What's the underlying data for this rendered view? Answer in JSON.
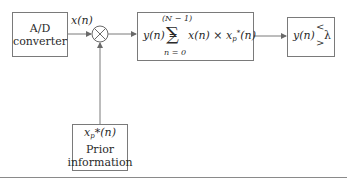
{
  "diagram": {
    "nodes": {
      "adc": {
        "line1": "A/D",
        "line2": "converter"
      },
      "multiplier": {
        "symbol": "multiply-circle"
      },
      "summation": {
        "lhs": "y(n) =",
        "upper_limit": "(N − 1)",
        "sigma": "∑",
        "lower_limit": "n = 0",
        "term_x": "x(n) × x",
        "term_sub": "p",
        "term_sup": "*",
        "term_tail": "(n)"
      },
      "decision": {
        "lhs": "y(n)",
        "lt": "<",
        "gt": ">",
        "threshold": "λ"
      },
      "prior": {
        "sym_x": "x",
        "sym_sub": "p",
        "sym_rest": "*(n)",
        "line2": "Prior",
        "line3": "information"
      }
    },
    "edges": {
      "adc_to_mult_label": "x(n)"
    },
    "colors": {
      "stroke": "#7a7a7a",
      "text": "#2a2a2a",
      "rule": "#8a8a8a"
    }
  }
}
